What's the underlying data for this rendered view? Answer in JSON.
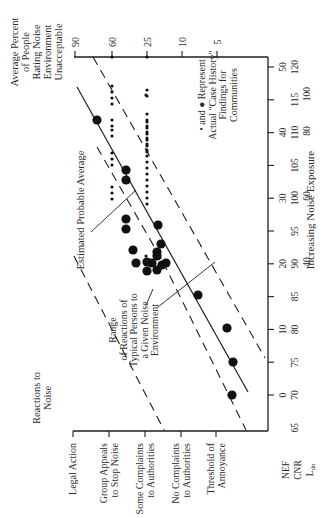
{
  "chart_data": {
    "type": "scatter",
    "orientation": "rotated-90-ccw",
    "title": "",
    "xlabel": "Increasing Noise Exposure",
    "ylabel_left": "Reactions to Noise",
    "ylabel_right": "Average Percent of People Rating Noise Environment Unacceptable",
    "x_scales": [
      {
        "name": "NEF",
        "ticks": [
          0,
          10,
          20,
          30,
          40,
          50
        ]
      },
      {
        "name": "CNR",
        "ticks": [
          65,
          70,
          75,
          80,
          85,
          90,
          95,
          100,
          105,
          110,
          115,
          120
        ]
      },
      {
        "name": "Ldn",
        "ticks": [
          40,
          60,
          80,
          100
        ]
      }
    ],
    "reaction_levels": [
      "Threshold of Annoyance",
      "No Complaints to Authorities",
      "Some Complaints to Authorities",
      "Group Appeals to Stop Noise",
      "Legal Action"
    ],
    "percent_scale": [
      5,
      10,
      25,
      60,
      90
    ],
    "series": [
      {
        "name": "Estimated Probable Average",
        "style": "solid line",
        "from": {
          "cnr": 70,
          "reaction": "Threshold of Annoyance"
        },
        "to": {
          "cnr": 117,
          "reaction": "Legal Action"
        }
      },
      {
        "name": "Range of Reactions (upper)",
        "style": "dashed line"
      },
      {
        "name": "Range of Reactions (lower)",
        "style": "dashed line"
      },
      {
        "name": "Case history findings (small dots)",
        "marker": "small dot",
        "approx_count": 60
      },
      {
        "name": "Case history findings (large dots)",
        "marker": "large dot",
        "approx_count": 20
      }
    ],
    "annotations": [
      "Estimated Probable Average",
      "Range of Reactions of Typical Persons to a Given Noise Environment",
      "• and ● Represent Actual \"Case History\" Findings for Communities"
    ],
    "grid": false,
    "legend_position": "inside, upper right (rotated)"
  },
  "labels": {
    "percent_axis_title": [
      "Average Percent",
      "of People",
      "Rating Noise",
      "Environment",
      "Unacceptable"
    ],
    "percent_ticks": [
      "90",
      "60",
      "25",
      "10",
      "5"
    ],
    "reactions_title": [
      "Reactions to",
      "Noise"
    ],
    "reactions": [
      [
        "Legal Action"
      ],
      [
        "Group Appeals",
        "to Stop Noise"
      ],
      [
        "Some Complaints",
        "to Authorities"
      ],
      [
        "No Complaints",
        "to Authorities"
      ],
      [
        "Threshold of",
        "Annoyance"
      ]
    ],
    "scale_names": [
      "NEF",
      "CNR",
      "Ldn"
    ],
    "nef_ticks": [
      "0",
      "10",
      "20",
      "30",
      "40",
      "50"
    ],
    "cnr_ticks": [
      "65",
      "70",
      "75",
      "80",
      "85",
      "90",
      "95",
      "100",
      "105",
      "110",
      "115",
      "120"
    ],
    "ldn_ticks": [
      "40",
      "60",
      "80",
      "100"
    ],
    "xlabel": "Increasing Noise Exposure",
    "annotation_average": "Estimated Probable Average",
    "annotation_range": [
      "Range",
      "of Reactions of",
      "Typical Persons to",
      "a Given Noise",
      "Environment"
    ],
    "legend": [
      "• and ● Represent",
      "Actual \"Case History\"",
      "Findings for",
      "Communities"
    ]
  }
}
